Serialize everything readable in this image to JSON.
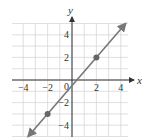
{
  "chart_data": {
    "type": "line",
    "title": "",
    "xlabel": "x",
    "ylabel": "y",
    "xlim": [
      -5,
      4.7
    ],
    "ylim": [
      -5,
      5
    ],
    "grid": true,
    "x_ticks": [
      -4,
      -2,
      0,
      2,
      4
    ],
    "y_ticks": [
      4,
      2,
      -2,
      -4
    ],
    "x_tick_labels": [
      "−4",
      "−2",
      "0",
      "2",
      "4"
    ],
    "y_tick_labels": [
      "4",
      "2",
      "−2",
      "−4"
    ],
    "origin_label": "0",
    "series": [
      {
        "name": "line",
        "equation": "y = (5/4)x - 1/2",
        "slope": 1.25,
        "intercept": -0.5,
        "x": [
          -3.6,
          4.4
        ],
        "y": [
          -5,
          5
        ],
        "arrows_both_ends": true,
        "color": "#777777"
      }
    ],
    "points": [
      {
        "x": 2,
        "y": 2
      },
      {
        "x": -2,
        "y": -3
      }
    ],
    "colors": {
      "grid": "#d8d8d8",
      "axis": "#333333",
      "line": "#777777",
      "point": "#666666"
    }
  }
}
